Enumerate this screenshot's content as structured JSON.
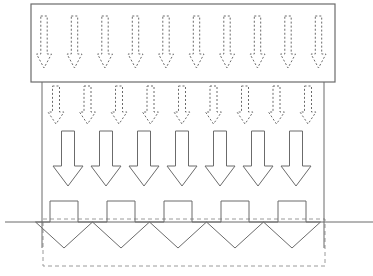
{
  "canvas": {
    "width": 373,
    "height": 276,
    "background": "#ffffff"
  },
  "style": {
    "stroke_color": "#6b6b6b",
    "stroke_color_dark": "#4a4a4a",
    "stroke_width_thin": 1,
    "stroke_width_box": 1.2,
    "fill": "none",
    "dash_pattern_arrow": "2,2",
    "dash_pattern_rect": "4,3"
  },
  "diagram": {
    "type": "flow-schematic",
    "title": ""
  },
  "reservoir_box": {
    "label": "reservoir-box",
    "x": 31,
    "y": 4,
    "width": 304,
    "height": 78,
    "stroke": "#6b6b6b",
    "fill": "none"
  },
  "ground_line": {
    "label": "ground-line",
    "x1": 5,
    "x2": 373,
    "y": 222,
    "stroke": "#6b6b6b"
  },
  "left_boundary": {
    "label": "left-boundary-line",
    "x": 42,
    "y1": 82,
    "y2": 248,
    "stroke": "#6b6b6b"
  },
  "right_boundary": {
    "label": "right-boundary-line",
    "x": 324,
    "y1": 82,
    "y2": 248,
    "stroke": "#6b6b6b"
  },
  "dashed_boundary_rect": {
    "label": "dashed-boundary-rect",
    "x": 43,
    "y": 219,
    "width": 282,
    "height": 47,
    "stroke": "#9a9a9a",
    "dash": "4,3"
  },
  "arrow_row_1": {
    "label": "top-dashed-arrow-row",
    "count": 10,
    "style": "dashed-outline",
    "start_x": 44,
    "spacing": 30.5,
    "top_y": 16,
    "tip_y": 68,
    "shaft_half_width": 3.2,
    "head_half_width": 7.5,
    "head_height": 14
  },
  "arrow_row_2": {
    "label": "second-dashed-arrow-row",
    "count": 9,
    "style": "dashed-outline",
    "start_x": 56,
    "spacing": 31.5,
    "top_y": 86,
    "tip_y": 124,
    "shaft_half_width": 3.5,
    "head_half_width": 8,
    "head_height": 12
  },
  "arrow_row_3": {
    "label": "third-solid-arrow-row",
    "count": 7,
    "style": "solid-outline",
    "start_x": 68,
    "spacing": 38,
    "top_y": 131,
    "tip_y": 186,
    "shaft_half_width": 6.5,
    "head_half_width": 15,
    "head_height": 20
  },
  "arrow_row_4": {
    "label": "bottom-large-arrow-row",
    "count": 5,
    "style": "solid-outline-sawtooth",
    "start_x": 64,
    "spacing": 57,
    "top_y": 201,
    "shoulder_y": 222,
    "tip_y": 248,
    "shaft_half_width": 14,
    "head_half_width": 28.5
  },
  "legend": {
    "items": []
  },
  "annotations": []
}
